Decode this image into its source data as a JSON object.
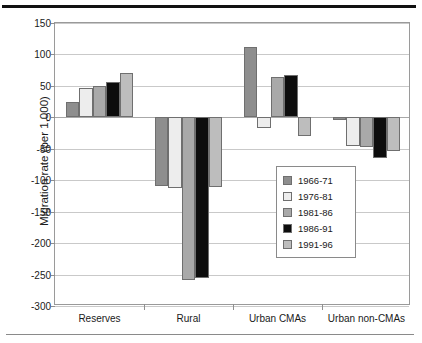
{
  "chart_data": {
    "type": "bar",
    "title": "",
    "xlabel": "",
    "ylabel": "Migration rate (per 1,000)",
    "ylim": [
      -300,
      150
    ],
    "ytick_labels": [
      "150",
      "100",
      "50",
      "0",
      "-50",
      "-100",
      "-150",
      "-200",
      "-250",
      "-300"
    ],
    "yticks": [
      150,
      100,
      50,
      0,
      -50,
      -100,
      -150,
      -200,
      -250,
      -300
    ],
    "grid": true,
    "legend_position": "right-lower",
    "categories": [
      "Reserves",
      "Rural",
      "Urban CMAs",
      "Urban non-CMAs"
    ],
    "series": [
      {
        "name": "1966-71",
        "color": "#8e8e8e",
        "values": [
          24,
          -109,
          112,
          -5
        ]
      },
      {
        "name": "1976-81",
        "color": "#ededed",
        "values": [
          46,
          -112,
          -17,
          -45
        ]
      },
      {
        "name": "1981-86",
        "color": "#a9a9a9",
        "values": [
          50,
          -258,
          64,
          -47
        ]
      },
      {
        "name": "1986-91",
        "color": "#0d0d0d",
        "values": [
          56,
          -255,
          67,
          -65
        ]
      },
      {
        "name": "1991-96",
        "color": "#bdbdbd",
        "values": [
          71,
          -110,
          -30,
          -54
        ]
      }
    ]
  },
  "legend": {
    "items": [
      {
        "label": "1966-71",
        "color": "#8e8e8e"
      },
      {
        "label": "1976-81",
        "color": "#ededed"
      },
      {
        "label": "1981-86",
        "color": "#a9a9a9"
      },
      {
        "label": "1986-91",
        "color": "#0d0d0d"
      },
      {
        "label": "1991-96",
        "color": "#bdbdbd"
      }
    ]
  }
}
